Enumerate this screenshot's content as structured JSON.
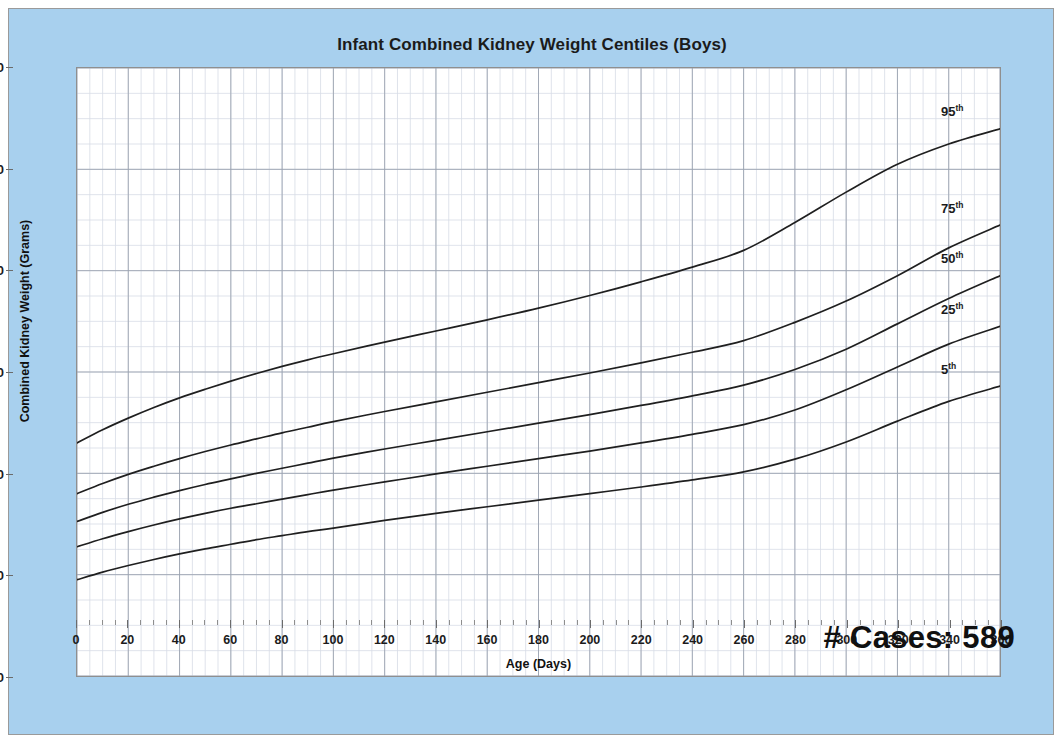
{
  "panel": {
    "background_color": "#a8d0ee",
    "border_color": "#9a9a9a"
  },
  "chart_data": {
    "type": "line",
    "title": "Infant Combined Kidney Weight Centiles (Boys)",
    "xlabel": "Age (Days)",
    "ylabel": "Combined Kidney Weight (Grams)",
    "xlim": [
      0,
      360
    ],
    "ylim": [
      0,
      120
    ],
    "x_major_step": 20,
    "x_minor_step": 5,
    "y_major_step": 20,
    "y_minor_step": 5,
    "grid": true,
    "legend_position": "inline-right-end-labels",
    "line_color": "#1f1f1f",
    "annotation": "# Cases: 589",
    "xticks": [
      0,
      20,
      40,
      60,
      80,
      100,
      120,
      140,
      160,
      180,
      200,
      220,
      240,
      260,
      280,
      300,
      320,
      340,
      360
    ],
    "yticks": [
      0,
      20,
      40,
      60,
      80,
      100,
      120
    ],
    "x": [
      0,
      10,
      20,
      30,
      40,
      50,
      60,
      70,
      80,
      90,
      100,
      120,
      140,
      160,
      180,
      200,
      220,
      240,
      260,
      280,
      300,
      320,
      340,
      360
    ],
    "series": [
      {
        "name": "95th",
        "label": "95",
        "label_suffix": "th",
        "values": [
          46.0,
          48.6,
          50.9,
          53.0,
          54.9,
          56.6,
          58.2,
          59.7,
          61.1,
          62.4,
          63.6,
          65.9,
          68.1,
          70.3,
          72.6,
          75.1,
          77.8,
          80.7,
          84.0,
          89.5,
          95.5,
          101.0,
          105.0,
          108.0
        ]
      },
      {
        "name": "75th",
        "label": "75",
        "label_suffix": "th",
        "values": [
          36.0,
          38.0,
          39.8,
          41.4,
          42.9,
          44.3,
          45.6,
          46.8,
          48.0,
          49.1,
          50.2,
          52.2,
          54.1,
          56.0,
          57.9,
          59.8,
          61.8,
          63.9,
          66.2,
          69.8,
          74.0,
          79.0,
          84.5,
          89.0
        ]
      },
      {
        "name": "50th",
        "label": "50",
        "label_suffix": "th",
        "values": [
          30.5,
          32.3,
          33.9,
          35.3,
          36.6,
          37.8,
          38.9,
          40.0,
          41.0,
          42.0,
          43.0,
          44.8,
          46.5,
          48.2,
          49.9,
          51.6,
          53.4,
          55.3,
          57.4,
          60.5,
          64.5,
          69.5,
          74.5,
          79.0
        ]
      },
      {
        "name": "25th",
        "label": "25",
        "label_suffix": "th",
        "values": [
          25.5,
          27.1,
          28.5,
          29.8,
          31.0,
          32.1,
          33.1,
          34.0,
          34.9,
          35.8,
          36.7,
          38.3,
          39.9,
          41.4,
          42.9,
          44.4,
          46.0,
          47.7,
          49.6,
          52.5,
          56.5,
          61.0,
          65.5,
          69.0
        ]
      },
      {
        "name": "5th",
        "label": "5",
        "label_suffix": "th",
        "values": [
          19.0,
          20.5,
          21.8,
          23.0,
          24.1,
          25.1,
          26.0,
          26.9,
          27.7,
          28.5,
          29.2,
          30.7,
          32.1,
          33.4,
          34.7,
          36.0,
          37.3,
          38.7,
          40.3,
          42.8,
          46.2,
          50.3,
          54.2,
          57.2
        ]
      }
    ]
  }
}
